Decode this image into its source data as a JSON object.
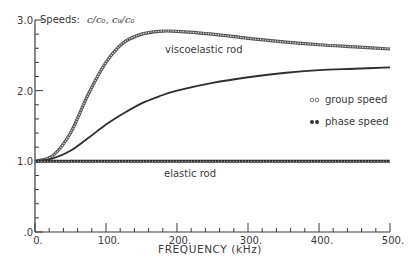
{
  "chart_data": {
    "type": "line",
    "title_prefix": "Speeds:",
    "title_formula": "c/c₀, c₉/c₀",
    "xlabel": "FREQUENCY (kHz)",
    "ylabel": "",
    "xlim": [
      0,
      500
    ],
    "ylim": [
      0,
      3.0
    ],
    "x_ticks": [
      "0.",
      "100.",
      "200.",
      "300.",
      "400.",
      "500."
    ],
    "y_ticks": [
      ".0",
      "1.0",
      "2.0",
      "3.0"
    ],
    "grid": false,
    "legend": [
      {
        "marker": "◦◦",
        "label": "group speed"
      },
      {
        "marker": "••",
        "label": "phase speed"
      }
    ],
    "annotations": [
      "viscoelastic rod",
      "elastic rod"
    ],
    "x": [
      0,
      25,
      50,
      75,
      100,
      125,
      150,
      175,
      200,
      250,
      300,
      350,
      400,
      450,
      500
    ],
    "series": [
      {
        "name": "viscoelastic rod group speed",
        "style": "open-dots",
        "values": [
          1.0,
          1.08,
          1.4,
          1.95,
          2.4,
          2.68,
          2.8,
          2.84,
          2.84,
          2.8,
          2.74,
          2.69,
          2.65,
          2.62,
          2.59
        ]
      },
      {
        "name": "viscoelastic rod phase speed",
        "style": "solid",
        "values": [
          1.0,
          1.04,
          1.15,
          1.33,
          1.52,
          1.68,
          1.82,
          1.92,
          2.0,
          2.11,
          2.19,
          2.25,
          2.29,
          2.31,
          2.33
        ]
      },
      {
        "name": "elastic rod",
        "style": "filled-dots",
        "values": [
          1.0,
          1.0,
          1.0,
          1.0,
          1.0,
          1.0,
          1.0,
          1.0,
          1.0,
          1.0,
          1.0,
          1.0,
          1.0,
          1.0,
          1.0
        ]
      }
    ]
  }
}
